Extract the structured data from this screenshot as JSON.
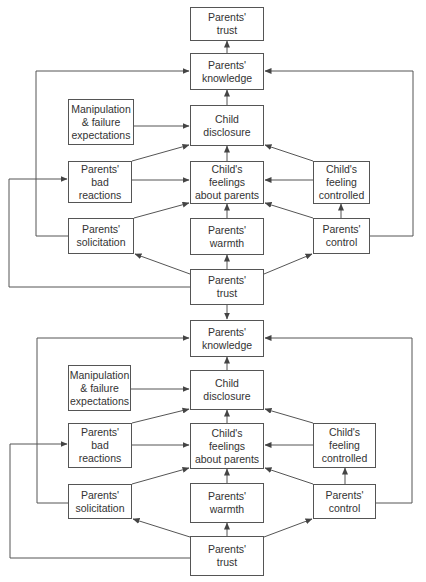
{
  "diagrams": [
    {
      "nodes": {
        "trust_top": "Parents'\ntrust",
        "knowledge": "Parents'\nknowledge",
        "manipulation": "Manipulation\n& failure\nexpectations",
        "disclosure": "Child\ndisclosure",
        "bad_reactions": "Parents'\nbad\nreactions",
        "feelings": "Child's\nfeelings\nabout parents",
        "feeling_controlled": "Child's\nfeeling\ncontrolled",
        "solicitation": "Parents'\nsolicitation",
        "warmth": "Parents'\nwarmth",
        "control": "Parents'\ncontrol",
        "trust_bottom": "Parents'\ntrust"
      }
    },
    {
      "nodes": {
        "knowledge": "Parents'\nknowledge",
        "manipulation": "Manipulation\n& failure\nexpectations",
        "disclosure": "Child\ndisclosure",
        "bad_reactions": "Parents'\nbad\nreactions",
        "feelings": "Child's\nfeelings\nabout parents",
        "feeling_controlled": "Child's\nfeeling\ncontrolled",
        "solicitation": "Parents'\nsolicitation",
        "warmth": "Parents'\nwarmth",
        "control": "Parents'\ncontrol",
        "trust_bottom": "Parents'\ntrust"
      }
    }
  ],
  "edges": [
    [
      "knowledge",
      "trust_top"
    ],
    [
      "disclosure",
      "knowledge"
    ],
    [
      "solicitation",
      "knowledge"
    ],
    [
      "control",
      "knowledge"
    ],
    [
      "manipulation",
      "disclosure"
    ],
    [
      "bad_reactions",
      "disclosure"
    ],
    [
      "feelings",
      "disclosure"
    ],
    [
      "feeling_controlled",
      "disclosure"
    ],
    [
      "bad_reactions",
      "feelings"
    ],
    [
      "feeling_controlled",
      "feelings"
    ],
    [
      "solicitation",
      "feelings"
    ],
    [
      "warmth",
      "feelings"
    ],
    [
      "control",
      "feelings"
    ],
    [
      "control",
      "feeling_controlled"
    ],
    [
      "trust_bottom",
      "solicitation"
    ],
    [
      "trust_bottom",
      "warmth"
    ],
    [
      "trust_bottom",
      "control"
    ],
    [
      "trust_bottom",
      "bad_reactions"
    ],
    [
      "trust_bottom",
      "knowledge"
    ]
  ],
  "colors": {
    "line": "#555555",
    "text": "#333333",
    "background": "#ffffff"
  }
}
